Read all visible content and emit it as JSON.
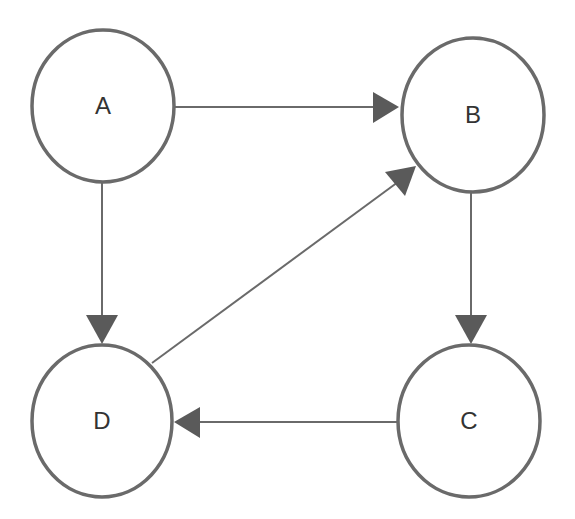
{
  "diagram": {
    "type": "directed-graph",
    "colors": {
      "stroke": "#6a6a6a",
      "arrow": "#5a5a5a",
      "label": "#333333",
      "node_fill": "#ffffff",
      "background": "#ffffff"
    },
    "nodes": [
      {
        "id": "A",
        "label": "A",
        "cx": 103,
        "cy": 106,
        "rx": 71,
        "ry": 76
      },
      {
        "id": "B",
        "label": "B",
        "cx": 473,
        "cy": 115,
        "rx": 71,
        "ry": 77
      },
      {
        "id": "C",
        "label": "C",
        "cx": 469,
        "cy": 421,
        "rx": 71,
        "ry": 76
      },
      {
        "id": "D",
        "label": "D",
        "cx": 102,
        "cy": 421,
        "rx": 70,
        "ry": 76
      }
    ],
    "edges": [
      {
        "from": "A",
        "to": "B"
      },
      {
        "from": "A",
        "to": "D"
      },
      {
        "from": "B",
        "to": "C"
      },
      {
        "from": "C",
        "to": "D"
      },
      {
        "from": "D",
        "to": "B"
      }
    ]
  }
}
